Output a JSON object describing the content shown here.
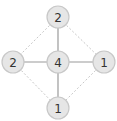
{
  "diagram": {
    "nodes": [
      {
        "id": "top",
        "label": "2",
        "x": 58,
        "y": 17
      },
      {
        "id": "left",
        "label": "2",
        "x": 13,
        "y": 62
      },
      {
        "id": "center",
        "label": "4",
        "x": 58,
        "y": 62
      },
      {
        "id": "right",
        "label": "1",
        "x": 104,
        "y": 62
      },
      {
        "id": "bottom",
        "label": "1",
        "x": 58,
        "y": 108
      }
    ],
    "edges": [
      {
        "from": "center",
        "to": "top",
        "style": "solid"
      },
      {
        "from": "center",
        "to": "left",
        "style": "solid"
      },
      {
        "from": "center",
        "to": "right",
        "style": "solid"
      },
      {
        "from": "center",
        "to": "bottom",
        "style": "solid"
      },
      {
        "from": "top",
        "to": "left",
        "style": "dotted"
      },
      {
        "from": "top",
        "to": "right",
        "style": "dotted"
      },
      {
        "from": "left",
        "to": "bottom",
        "style": "dotted"
      },
      {
        "from": "right",
        "to": "bottom",
        "style": "dotted"
      }
    ],
    "node_radius": 11,
    "colors": {
      "node_fill": "#e6e6e6",
      "node_stroke": "#c8c8c8",
      "solid_edge": "#9a9a9a",
      "dotted_edge": "#c8c8c8",
      "text": "#333333"
    }
  }
}
